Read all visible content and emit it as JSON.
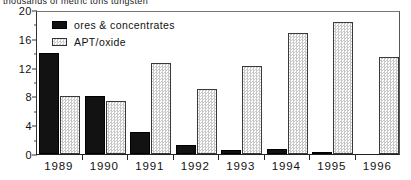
{
  "chart_data": {
    "type": "bar",
    "title": "thousands of metric tons tungsten",
    "xlabel": "",
    "ylabel": "",
    "ylim": [
      0,
      20
    ],
    "yticks": [
      0,
      4,
      8,
      12,
      16,
      20
    ],
    "ytick_labels": [
      "0",
      "4",
      "8",
      "12",
      "16",
      "20"
    ],
    "minor_tick_step": 2,
    "grid": false,
    "legend_position": "top-left-inside",
    "categories": [
      "1989",
      "1990",
      "1991",
      "1992",
      "1993",
      "1994",
      "1995",
      "1996"
    ],
    "series": [
      {
        "name": "ores & concentrates",
        "fill": "solid-black",
        "values": [
          14.0,
          8.1,
          3.1,
          1.2,
          0.5,
          0.7,
          0.25,
          0.0
        ]
      },
      {
        "name": "APT/oxide",
        "fill": "checkered-light",
        "values": [
          8.0,
          7.4,
          12.7,
          9.0,
          12.2,
          16.8,
          18.3,
          13.5
        ]
      }
    ]
  },
  "colors": {
    "series_dark": "#121212",
    "series_light": "#f4f4f4",
    "series_light_pattern": "#c9c9c9",
    "axis": "#222222",
    "text": "#111111",
    "background": "#ffffff"
  }
}
